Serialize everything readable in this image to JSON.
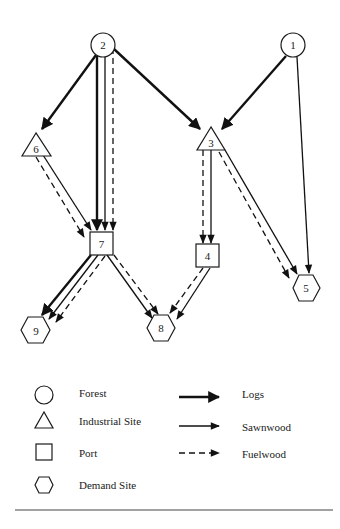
{
  "nodes": [
    {
      "id": "1",
      "type": "forest",
      "x": 293,
      "y": 45
    },
    {
      "id": "2",
      "type": "forest",
      "x": 103,
      "y": 45
    },
    {
      "id": "3",
      "type": "industrial",
      "x": 211,
      "y": 141
    },
    {
      "id": "4",
      "type": "port",
      "x": 207,
      "y": 256
    },
    {
      "id": "5",
      "type": "demand",
      "x": 306,
      "y": 288
    },
    {
      "id": "6",
      "type": "industrial",
      "x": 36,
      "y": 146
    },
    {
      "id": "7",
      "type": "port",
      "x": 101,
      "y": 243
    },
    {
      "id": "8",
      "type": "demand",
      "x": 161,
      "y": 328
    },
    {
      "id": "9",
      "type": "demand",
      "x": 36,
      "y": 329
    }
  ],
  "edges": [
    {
      "from": "2",
      "to": "6",
      "flow": "logs"
    },
    {
      "from": "2",
      "to": "7",
      "flow": "logs"
    },
    {
      "from": "2",
      "to": "7",
      "flow": "sawnwood"
    },
    {
      "from": "2",
      "to": "7",
      "flow": "fuelwood"
    },
    {
      "from": "2",
      "to": "3",
      "flow": "logs"
    },
    {
      "from": "1",
      "to": "3",
      "flow": "logs"
    },
    {
      "from": "1",
      "to": "5",
      "flow": "sawnwood"
    },
    {
      "from": "6",
      "to": "7",
      "flow": "sawnwood"
    },
    {
      "from": "6",
      "to": "7",
      "flow": "fuelwood"
    },
    {
      "from": "3",
      "to": "4",
      "flow": "sawnwood"
    },
    {
      "from": "3",
      "to": "4",
      "flow": "fuelwood"
    },
    {
      "from": "3",
      "to": "5",
      "flow": "sawnwood"
    },
    {
      "from": "3",
      "to": "5",
      "flow": "fuelwood"
    },
    {
      "from": "7",
      "to": "9",
      "flow": "logs"
    },
    {
      "from": "7",
      "to": "9",
      "flow": "sawnwood"
    },
    {
      "from": "7",
      "to": "9",
      "flow": "fuelwood"
    },
    {
      "from": "7",
      "to": "8",
      "flow": "sawnwood"
    },
    {
      "from": "7",
      "to": "8",
      "flow": "fuelwood"
    },
    {
      "from": "4",
      "to": "8",
      "flow": "sawnwood"
    },
    {
      "from": "4",
      "to": "8",
      "flow": "fuelwood"
    }
  ],
  "legend": {
    "node_types": [
      {
        "shape": "circle",
        "label": "Forest"
      },
      {
        "shape": "triangle",
        "label": "Industrial Site"
      },
      {
        "shape": "square",
        "label": "Port"
      },
      {
        "shape": "hexagon",
        "label": "Demand Site"
      }
    ],
    "flow_types": [
      {
        "style": "thick-solid",
        "label": "Logs"
      },
      {
        "style": "thin-solid",
        "label": "Sawnwood"
      },
      {
        "style": "dashed",
        "label": "Fuelwood"
      }
    ]
  },
  "colors": {
    "ink": "#1a1a1a",
    "background": "#ffffff"
  }
}
